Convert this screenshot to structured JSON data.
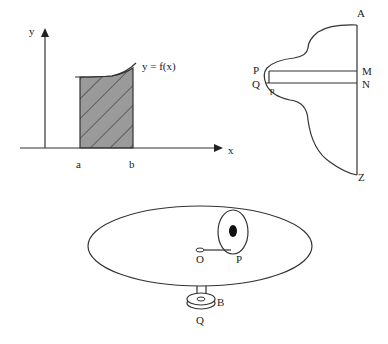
{
  "figure1": {
    "y_axis_label": "y",
    "x_axis_label": "x",
    "curve_label": "y = f(x)",
    "left_bound_label": "a",
    "right_bound_label": "b",
    "fill_color": "#9a9a9a"
  },
  "figure2": {
    "labels": {
      "A": "A",
      "P": "P",
      "Q": "Q",
      "p": "p",
      "M": "M",
      "N": "N",
      "Z": "Z"
    }
  },
  "figure3": {
    "labels": {
      "O": "O",
      "P": "P",
      "B": "B",
      "Q": "Q"
    },
    "dot_color": "#111111"
  }
}
